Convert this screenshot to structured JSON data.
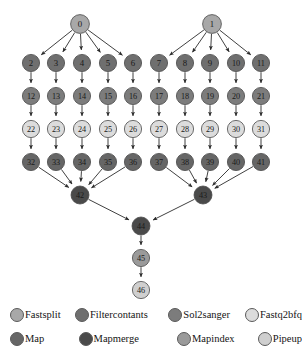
{
  "diagram": {
    "type": "directed-acyclic-graph",
    "node_radius": 8.6,
    "root_radius": 9.4,
    "canvas": {
      "width": 302,
      "height": 361
    },
    "colors": {
      "fastsplit": "#a8a8a8",
      "filtercontants": "#6f6f6f",
      "sol2sanger": "#7c7c7c",
      "fastq2bfq": "#dcdcdc",
      "map": "#666666",
      "mapmerge": "#4a4a4a",
      "mapindex": "#9a9a9a",
      "pipeup": "#cfcfcf",
      "edge": "#2b2b2b",
      "node_stroke": "#4a4a4a",
      "label": "#1a1a1a",
      "background": "#ffffff"
    },
    "nodes": [
      {
        "id": "0",
        "label": "0",
        "x": 80,
        "y": 24,
        "r": 9.4,
        "type": "fastsplit"
      },
      {
        "id": "1",
        "label": "1",
        "x": 212,
        "y": 24,
        "r": 9.4,
        "type": "fastsplit"
      },
      {
        "id": "2",
        "label": "2",
        "x": 31,
        "y": 63,
        "r": 8.6,
        "type": "filtercontants"
      },
      {
        "id": "3",
        "label": "3",
        "x": 56,
        "y": 63,
        "r": 8.6,
        "type": "filtercontants"
      },
      {
        "id": "4",
        "label": "4",
        "x": 82,
        "y": 63,
        "r": 8.6,
        "type": "filtercontants"
      },
      {
        "id": "5",
        "label": "5",
        "x": 108,
        "y": 63,
        "r": 8.6,
        "type": "filtercontants"
      },
      {
        "id": "6",
        "label": "6",
        "x": 133,
        "y": 63,
        "r": 8.6,
        "type": "filtercontants"
      },
      {
        "id": "7",
        "label": "7",
        "x": 159,
        "y": 63,
        "r": 8.6,
        "type": "filtercontants"
      },
      {
        "id": "8",
        "label": "8",
        "x": 185,
        "y": 63,
        "r": 8.6,
        "type": "filtercontants"
      },
      {
        "id": "9",
        "label": "9",
        "x": 210,
        "y": 63,
        "r": 8.6,
        "type": "filtercontants"
      },
      {
        "id": "10",
        "label": "10",
        "x": 236,
        "y": 63,
        "r": 8.6,
        "type": "filtercontants"
      },
      {
        "id": "11",
        "label": "11",
        "x": 261,
        "y": 63,
        "r": 8.6,
        "type": "filtercontants"
      },
      {
        "id": "12",
        "label": "12",
        "x": 31,
        "y": 96,
        "r": 8.6,
        "type": "sol2sanger"
      },
      {
        "id": "13",
        "label": "13",
        "x": 56,
        "y": 96,
        "r": 8.6,
        "type": "sol2sanger"
      },
      {
        "id": "14",
        "label": "14",
        "x": 82,
        "y": 96,
        "r": 8.6,
        "type": "sol2sanger"
      },
      {
        "id": "15",
        "label": "15",
        "x": 108,
        "y": 96,
        "r": 8.6,
        "type": "sol2sanger"
      },
      {
        "id": "16",
        "label": "16",
        "x": 133,
        "y": 96,
        "r": 8.6,
        "type": "sol2sanger"
      },
      {
        "id": "17",
        "label": "17",
        "x": 159,
        "y": 96,
        "r": 8.6,
        "type": "sol2sanger"
      },
      {
        "id": "18",
        "label": "18",
        "x": 185,
        "y": 96,
        "r": 8.6,
        "type": "sol2sanger"
      },
      {
        "id": "19",
        "label": "19",
        "x": 210,
        "y": 96,
        "r": 8.6,
        "type": "sol2sanger"
      },
      {
        "id": "20",
        "label": "20",
        "x": 236,
        "y": 96,
        "r": 8.6,
        "type": "sol2sanger"
      },
      {
        "id": "21",
        "label": "21",
        "x": 261,
        "y": 96,
        "r": 8.6,
        "type": "sol2sanger"
      },
      {
        "id": "22",
        "label": "22",
        "x": 31,
        "y": 129,
        "r": 8.6,
        "type": "fastq2bfq"
      },
      {
        "id": "23",
        "label": "23",
        "x": 56,
        "y": 129,
        "r": 8.6,
        "type": "fastq2bfq"
      },
      {
        "id": "24",
        "label": "24",
        "x": 82,
        "y": 129,
        "r": 8.6,
        "type": "fastq2bfq"
      },
      {
        "id": "25",
        "label": "25",
        "x": 108,
        "y": 129,
        "r": 8.6,
        "type": "fastq2bfq"
      },
      {
        "id": "26",
        "label": "26",
        "x": 133,
        "y": 129,
        "r": 8.6,
        "type": "fastq2bfq"
      },
      {
        "id": "27",
        "label": "27",
        "x": 159,
        "y": 129,
        "r": 8.6,
        "type": "fastq2bfq"
      },
      {
        "id": "28",
        "label": "28",
        "x": 185,
        "y": 129,
        "r": 8.6,
        "type": "fastq2bfq"
      },
      {
        "id": "29",
        "label": "29",
        "x": 210,
        "y": 129,
        "r": 8.6,
        "type": "fastq2bfq"
      },
      {
        "id": "30",
        "label": "30",
        "x": 236,
        "y": 129,
        "r": 8.6,
        "type": "fastq2bfq"
      },
      {
        "id": "31",
        "label": "31",
        "x": 261,
        "y": 129,
        "r": 8.6,
        "type": "fastq2bfq"
      },
      {
        "id": "32",
        "label": "32",
        "x": 31,
        "y": 162,
        "r": 8.6,
        "type": "map"
      },
      {
        "id": "33",
        "label": "33",
        "x": 56,
        "y": 162,
        "r": 8.6,
        "type": "map"
      },
      {
        "id": "34",
        "label": "34",
        "x": 82,
        "y": 162,
        "r": 8.6,
        "type": "map"
      },
      {
        "id": "35",
        "label": "35",
        "x": 108,
        "y": 162,
        "r": 8.6,
        "type": "map"
      },
      {
        "id": "36",
        "label": "36",
        "x": 133,
        "y": 162,
        "r": 8.6,
        "type": "map"
      },
      {
        "id": "37",
        "label": "37",
        "x": 159,
        "y": 162,
        "r": 8.6,
        "type": "map"
      },
      {
        "id": "38",
        "label": "38",
        "x": 185,
        "y": 162,
        "r": 8.6,
        "type": "map"
      },
      {
        "id": "39",
        "label": "39",
        "x": 210,
        "y": 162,
        "r": 8.6,
        "type": "map"
      },
      {
        "id": "40",
        "label": "40",
        "x": 236,
        "y": 162,
        "r": 8.6,
        "type": "map"
      },
      {
        "id": "41",
        "label": "41",
        "x": 261,
        "y": 162,
        "r": 8.6,
        "type": "map"
      },
      {
        "id": "42",
        "label": "42",
        "x": 80,
        "y": 195,
        "r": 9.0,
        "type": "mapmerge"
      },
      {
        "id": "43",
        "label": "43",
        "x": 203,
        "y": 195,
        "r": 9.0,
        "type": "mapmerge"
      },
      {
        "id": "44",
        "label": "44",
        "x": 141,
        "y": 226,
        "r": 9.0,
        "type": "mapmerge"
      },
      {
        "id": "45",
        "label": "45",
        "x": 141,
        "y": 258,
        "r": 8.6,
        "type": "mapindex"
      },
      {
        "id": "46",
        "label": "46",
        "x": 141,
        "y": 290,
        "r": 8.6,
        "type": "pipeup"
      }
    ],
    "edges": [
      [
        "0",
        "2"
      ],
      [
        "0",
        "3"
      ],
      [
        "0",
        "4"
      ],
      [
        "0",
        "5"
      ],
      [
        "0",
        "6"
      ],
      [
        "1",
        "7"
      ],
      [
        "1",
        "8"
      ],
      [
        "1",
        "9"
      ],
      [
        "1",
        "10"
      ],
      [
        "1",
        "11"
      ],
      [
        "2",
        "12"
      ],
      [
        "3",
        "13"
      ],
      [
        "4",
        "14"
      ],
      [
        "5",
        "15"
      ],
      [
        "6",
        "16"
      ],
      [
        "7",
        "17"
      ],
      [
        "8",
        "18"
      ],
      [
        "9",
        "19"
      ],
      [
        "10",
        "20"
      ],
      [
        "11",
        "21"
      ],
      [
        "12",
        "22"
      ],
      [
        "13",
        "23"
      ],
      [
        "14",
        "24"
      ],
      [
        "15",
        "25"
      ],
      [
        "16",
        "26"
      ],
      [
        "17",
        "27"
      ],
      [
        "18",
        "28"
      ],
      [
        "19",
        "29"
      ],
      [
        "20",
        "30"
      ],
      [
        "21",
        "31"
      ],
      [
        "22",
        "32"
      ],
      [
        "23",
        "33"
      ],
      [
        "24",
        "34"
      ],
      [
        "25",
        "35"
      ],
      [
        "26",
        "36"
      ],
      [
        "27",
        "37"
      ],
      [
        "28",
        "38"
      ],
      [
        "29",
        "39"
      ],
      [
        "30",
        "40"
      ],
      [
        "31",
        "41"
      ],
      [
        "32",
        "42"
      ],
      [
        "33",
        "42"
      ],
      [
        "34",
        "42"
      ],
      [
        "35",
        "42"
      ],
      [
        "36",
        "42"
      ],
      [
        "37",
        "43"
      ],
      [
        "38",
        "43"
      ],
      [
        "39",
        "43"
      ],
      [
        "40",
        "43"
      ],
      [
        "41",
        "43"
      ],
      [
        "42",
        "44"
      ],
      [
        "43",
        "44"
      ],
      [
        "44",
        "45"
      ],
      [
        "45",
        "46"
      ]
    ]
  },
  "legend": {
    "rows": [
      [
        {
          "label": "Fastsplit",
          "type": "fastsplit"
        },
        {
          "label": "Filtercontants",
          "type": "filtercontants"
        },
        {
          "label": "Sol2sanger",
          "type": "sol2sanger"
        },
        {
          "label": "Fastq2bfq",
          "type": "fastq2bfq"
        }
      ],
      [
        {
          "label": "Map",
          "type": "map"
        },
        {
          "label": "Mapmerge",
          "type": "mapmerge"
        },
        {
          "label": "Mapindex",
          "type": "mapindex"
        },
        {
          "label": "Pipeup",
          "type": "pipeup"
        }
      ]
    ]
  }
}
